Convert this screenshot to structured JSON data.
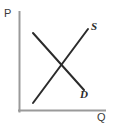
{
  "chart_data": {
    "type": "line",
    "title": "",
    "xlabel": "Q",
    "ylabel": "P",
    "grid": false,
    "legend": "inline-curve-labels",
    "axis_style": {
      "axis_color": "#9a9a9a",
      "curve_color": "#2b2b2b",
      "background": "#ffffff"
    },
    "axes": {
      "y_axis": {
        "label": "P",
        "from": [
          19,
          111
        ],
        "to": [
          19,
          12
        ]
      },
      "x_axis": {
        "label": "Q",
        "from": [
          19,
          111
        ],
        "to": [
          105,
          111
        ]
      }
    },
    "series": [
      {
        "name": "S",
        "label": "S",
        "description": "supply curve, upward sloping",
        "points": [
          [
            33,
            103
          ],
          [
            88,
            29
          ]
        ]
      },
      {
        "name": "D",
        "label": "D",
        "description": "demand curve, downward sloping",
        "points": [
          [
            33,
            33
          ],
          [
            84,
            90
          ]
        ]
      }
    ],
    "intersection": [
      62,
      67
    ],
    "annotations": [
      {
        "text": "P",
        "role": "y-axis-label",
        "x": 4,
        "y": 8
      },
      {
        "text": "Q",
        "role": "x-axis-label",
        "x": 97,
        "y": 112
      },
      {
        "text": "S",
        "role": "supply-curve-label",
        "x": 91,
        "y": 21
      },
      {
        "text": "D",
        "role": "demand-curve-label",
        "x": 80,
        "y": 89
      }
    ]
  },
  "labels": {
    "price_axis": "P",
    "quantity_axis": "Q",
    "supply_curve": "S",
    "demand_curve": "D"
  }
}
